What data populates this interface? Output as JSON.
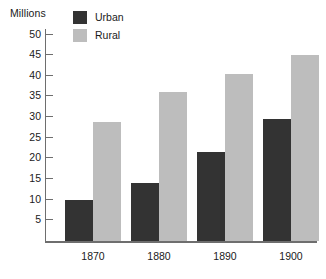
{
  "chart_data": {
    "type": "bar",
    "title": "",
    "ylabel": "Millions",
    "xlabel": "",
    "categories": [
      "1870",
      "1880",
      "1890",
      "1900"
    ],
    "series": [
      {
        "name": "Urban",
        "color": "#333333",
        "values": [
          10,
          14,
          21.5,
          29.5
        ]
      },
      {
        "name": "Rural",
        "color": "#bdbdbd",
        "values": [
          28.8,
          36,
          40.5,
          45
        ]
      }
    ],
    "ylim": [
      0,
      50
    ],
    "ytick_step": 5,
    "ytick_labels": [
      "50",
      "45",
      "40",
      "35",
      "30",
      "25",
      "20",
      "15",
      "10",
      "5"
    ],
    "grid": false,
    "legend_position": "top-left"
  },
  "axis": {
    "unit_label": "Millions"
  },
  "legend": {
    "items": [
      {
        "label": "Urban",
        "color": "#333333"
      },
      {
        "label": "Rural",
        "color": "#bdbdbd"
      }
    ]
  }
}
